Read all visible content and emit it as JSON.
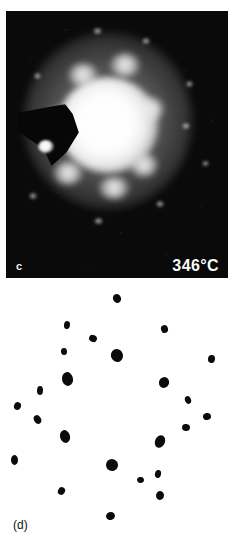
{
  "figure": {
    "type": "electron-diffraction-figure",
    "panels": [
      {
        "id": "c",
        "label": "c",
        "kind": "diffraction-photograph",
        "temperature_label": "346°C",
        "background_color": "#0a0a0a",
        "description_elements": [
          "bright central transmitted disc",
          "diffuse outer halo ring",
          "six-fold ring of bright halo spots",
          "faint outer diffraction spots",
          "dark beam-stop wedge at left",
          "bright reflection inside beam stop"
        ]
      },
      {
        "id": "d",
        "label": "(d)",
        "kind": "schematic-spot-map",
        "background_color": "#ffffff",
        "spot_color": "#0b0b0b"
      }
    ]
  },
  "chart_data": {
    "type": "scatter",
    "title": "",
    "xlabel": "",
    "ylabel": "",
    "xlim": [
      0,
      236
    ],
    "ylim": [
      0,
      264
    ],
    "grid": false,
    "legend": null,
    "note": "Panel (d): schematic electron-diffraction spot map. x,y in panel pixel coordinates (origin top-left of panel); w,h are spot diameters in px.",
    "series": [
      {
        "name": "diffraction-spots",
        "points": [
          {
            "x": 117,
            "y": 15,
            "w": 8,
            "h": 9
          },
          {
            "x": 67,
            "y": 42,
            "w": 6,
            "h": 8
          },
          {
            "x": 164,
            "y": 46,
            "w": 7,
            "h": 8
          },
          {
            "x": 93,
            "y": 55,
            "w": 8,
            "h": 7
          },
          {
            "x": 64,
            "y": 68,
            "w": 6,
            "h": 7
          },
          {
            "x": 117,
            "y": 72,
            "w": 12,
            "h": 13
          },
          {
            "x": 211,
            "y": 76,
            "w": 7,
            "h": 8
          },
          {
            "x": 67,
            "y": 96,
            "w": 11,
            "h": 14
          },
          {
            "x": 164,
            "y": 99,
            "w": 10,
            "h": 11
          },
          {
            "x": 40,
            "y": 107,
            "w": 6,
            "h": 9
          },
          {
            "x": 188,
            "y": 117,
            "w": 6,
            "h": 8
          },
          {
            "x": 17,
            "y": 123,
            "w": 7,
            "h": 8
          },
          {
            "x": 207,
            "y": 133,
            "w": 8,
            "h": 7
          },
          {
            "x": 37,
            "y": 136,
            "w": 7,
            "h": 9
          },
          {
            "x": 186,
            "y": 144,
            "w": 8,
            "h": 7
          },
          {
            "x": 65,
            "y": 153,
            "w": 10,
            "h": 13
          },
          {
            "x": 160,
            "y": 158,
            "w": 10,
            "h": 13
          },
          {
            "x": 14,
            "y": 177,
            "w": 7,
            "h": 10
          },
          {
            "x": 112,
            "y": 182,
            "w": 12,
            "h": 12
          },
          {
            "x": 158,
            "y": 191,
            "w": 6,
            "h": 8
          },
          {
            "x": 140,
            "y": 197,
            "w": 7,
            "h": 6
          },
          {
            "x": 61,
            "y": 208,
            "w": 7,
            "h": 8
          },
          {
            "x": 160,
            "y": 212,
            "w": 8,
            "h": 9
          },
          {
            "x": 110,
            "y": 233,
            "w": 9,
            "h": 8
          }
        ]
      }
    ]
  },
  "photo_features": {
    "halo_spots": [
      {
        "x": 62,
        "y": 52,
        "w": 30,
        "h": 24
      },
      {
        "x": 104,
        "y": 42,
        "w": 30,
        "h": 24
      },
      {
        "x": 40,
        "y": 96,
        "w": 24,
        "h": 26
      },
      {
        "x": 132,
        "y": 86,
        "w": 26,
        "h": 24
      },
      {
        "x": 47,
        "y": 150,
        "w": 30,
        "h": 24
      },
      {
        "x": 124,
        "y": 142,
        "w": 28,
        "h": 24
      },
      {
        "x": 92,
        "y": 166,
        "w": 32,
        "h": 22
      }
    ],
    "faint_spots": [
      {
        "x": 87,
        "y": 17,
        "w": 9,
        "h": 6
      },
      {
        "x": 136,
        "y": 27,
        "w": 8,
        "h": 6
      },
      {
        "x": 180,
        "y": 70,
        "w": 7,
        "h": 6
      },
      {
        "x": 176,
        "y": 112,
        "w": 8,
        "h": 6
      },
      {
        "x": 28,
        "y": 62,
        "w": 7,
        "h": 6
      },
      {
        "x": 23,
        "y": 182,
        "w": 8,
        "h": 6
      },
      {
        "x": 88,
        "y": 207,
        "w": 9,
        "h": 6
      },
      {
        "x": 150,
        "y": 190,
        "w": 8,
        "h": 6
      },
      {
        "x": 196,
        "y": 150,
        "w": 7,
        "h": 5
      }
    ]
  }
}
